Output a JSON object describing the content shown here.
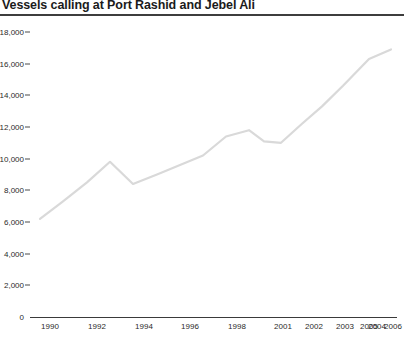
{
  "chart_data": {
    "type": "line",
    "title": "Vessels calling at Port Rashid and Jebel Ali",
    "xlabel": "",
    "ylabel": "",
    "ylim": [
      0,
      18000
    ],
    "xlim": [
      1990,
      2006
    ],
    "grid": false,
    "legend": null,
    "legend_position": "none",
    "line_color": "#d9d9d9",
    "axis_color": "#3a3a3a",
    "title_color": "#1b1b1b",
    "y_ticks": [
      0,
      2000,
      4000,
      6000,
      8000,
      10000,
      12000,
      14000,
      16000,
      18000
    ],
    "y_tick_labels": [
      "0",
      "2,000",
      "4,000",
      "6,000",
      "8,000",
      "10,000",
      "12,000",
      "14,000",
      "16,000",
      "18,000"
    ],
    "x_tick_labels": [
      "1990",
      "1992",
      "1994",
      "1996",
      "1998",
      "2001",
      "2002",
      "2003",
      "2004",
      "2005",
      "2006"
    ],
    "x": [
      1990,
      1991,
      1992,
      1993,
      1994,
      1995,
      1996,
      1997,
      1998,
      1999,
      2000,
      2001,
      2002,
      2003,
      2004,
      2005,
      2006
    ],
    "values": [
      6200,
      7300,
      8500,
      9800,
      8400,
      9000,
      9600,
      10200,
      11400,
      11800,
      11100,
      11000,
      12200,
      13300,
      14600,
      16300,
      16900
    ],
    "series": [
      {
        "name": "Vessels calling",
        "values": [
          6200,
          7300,
          8500,
          9800,
          8400,
          9000,
          9600,
          10200,
          11400,
          11800,
          11100,
          11000,
          12200,
          13300,
          14600,
          16300,
          16900
        ]
      }
    ]
  }
}
